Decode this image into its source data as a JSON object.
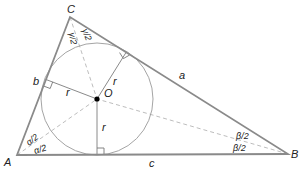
{
  "diagram": {
    "colors": {
      "triangle": "#8a8a8a",
      "circle": "#9a9a9a",
      "radius": "#8a8a8a",
      "bisector": "#b5b5b5",
      "center_dot": "#000000",
      "text": "#222222"
    },
    "vertices": {
      "A": {
        "label": "A",
        "x": 17,
        "y": 155
      },
      "B": {
        "label": "B",
        "x": 288,
        "y": 154
      },
      "C": {
        "label": "C",
        "x": 70,
        "y": 17
      }
    },
    "incenter": {
      "label": "O",
      "x": 97,
      "y": 99
    },
    "inradius_px": 56,
    "sides": {
      "a": {
        "label": "a"
      },
      "b": {
        "label": "b"
      },
      "c": {
        "label": "c"
      }
    },
    "radius_label": "r",
    "angle_labels": {
      "alpha_half": "α/2",
      "beta_half": "β/2",
      "gamma_half": "γ/2"
    }
  }
}
